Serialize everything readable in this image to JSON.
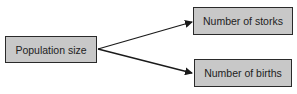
{
  "diagram": {
    "nodes": [
      {
        "id": "population",
        "label": "Population size"
      },
      {
        "id": "storks",
        "label": "Number of storks"
      },
      {
        "id": "births",
        "label": "Number of births"
      }
    ],
    "edges": [
      {
        "from": "population",
        "to": "storks"
      },
      {
        "from": "population",
        "to": "births"
      }
    ],
    "colors": {
      "box_fill": "#c8c8c8",
      "border": "#2a2a2a"
    }
  }
}
